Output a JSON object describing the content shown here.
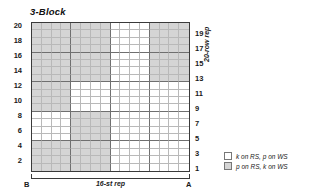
{
  "title": "3-Block",
  "axes": {
    "left_row_numbers": [
      20,
      18,
      16,
      14,
      12,
      10,
      8,
      6,
      4,
      2
    ],
    "right_row_numbers": [
      19,
      17,
      15,
      13,
      11,
      9,
      7,
      5,
      3,
      1
    ],
    "vertical_rep_label": "20-row rep",
    "horizontal_rep_label": "16-st rep",
    "left_marker": "B",
    "right_marker": "A"
  },
  "legend": [
    {
      "swatch": "white",
      "label": "k on RS, p on WS"
    },
    {
      "swatch": "gray",
      "label": "p on RS, k on WS"
    }
  ],
  "colors": {
    "gray_cell": "#d5d5d5",
    "white_cell": "#ffffff",
    "grid_line": "#b9b9b9",
    "block_line": "#6f6f6f",
    "frame": "#3a3a3a"
  },
  "chart_data": {
    "type": "heatmap",
    "title": "3-Block",
    "xlabel": "16-st rep",
    "ylabel": "20-row rep",
    "columns": 16,
    "rows": 20,
    "value_legend": {
      "1": "p on RS, k on WS",
      "0": "k on RS, p on WS"
    },
    "row_labels_top_to_bottom": [
      20,
      19,
      18,
      17,
      16,
      15,
      14,
      13,
      12,
      11,
      10,
      9,
      8,
      7,
      6,
      5,
      4,
      3,
      2,
      1
    ],
    "grid_top_to_bottom": [
      [
        1,
        1,
        1,
        1,
        1,
        1,
        1,
        1,
        0,
        0,
        0,
        0,
        1,
        1,
        1,
        1
      ],
      [
        1,
        1,
        1,
        1,
        1,
        1,
        1,
        1,
        0,
        0,
        0,
        0,
        1,
        1,
        1,
        1
      ],
      [
        1,
        1,
        1,
        1,
        1,
        1,
        1,
        1,
        0,
        0,
        0,
        0,
        1,
        1,
        1,
        1
      ],
      [
        1,
        1,
        1,
        1,
        1,
        1,
        1,
        1,
        0,
        0,
        0,
        0,
        1,
        1,
        1,
        1
      ],
      [
        1,
        1,
        1,
        1,
        1,
        1,
        1,
        1,
        0,
        0,
        0,
        0,
        1,
        1,
        1,
        1
      ],
      [
        1,
        1,
        1,
        1,
        1,
        1,
        1,
        1,
        0,
        0,
        0,
        0,
        1,
        1,
        1,
        1
      ],
      [
        1,
        1,
        1,
        1,
        1,
        1,
        1,
        1,
        0,
        0,
        0,
        0,
        1,
        1,
        1,
        1
      ],
      [
        1,
        1,
        1,
        1,
        1,
        1,
        1,
        1,
        0,
        0,
        0,
        0,
        1,
        1,
        1,
        1
      ],
      [
        1,
        1,
        1,
        1,
        0,
        0,
        0,
        0,
        0,
        0,
        0,
        0,
        0,
        0,
        0,
        0
      ],
      [
        1,
        1,
        1,
        1,
        0,
        0,
        0,
        0,
        0,
        0,
        0,
        0,
        0,
        0,
        0,
        0
      ],
      [
        1,
        1,
        1,
        1,
        0,
        0,
        0,
        0,
        0,
        0,
        0,
        0,
        0,
        0,
        0,
        0
      ],
      [
        1,
        1,
        1,
        1,
        0,
        0,
        0,
        0,
        0,
        0,
        0,
        0,
        0,
        0,
        0,
        0
      ],
      [
        0,
        0,
        0,
        0,
        1,
        1,
        1,
        1,
        0,
        0,
        0,
        0,
        0,
        0,
        0,
        0
      ],
      [
        0,
        0,
        0,
        0,
        1,
        1,
        1,
        1,
        0,
        0,
        0,
        0,
        0,
        0,
        0,
        0
      ],
      [
        0,
        0,
        0,
        0,
        1,
        1,
        1,
        1,
        0,
        0,
        0,
        0,
        0,
        0,
        0,
        0
      ],
      [
        0,
        0,
        0,
        0,
        1,
        1,
        1,
        1,
        0,
        0,
        0,
        0,
        0,
        0,
        0,
        0
      ],
      [
        1,
        1,
        1,
        1,
        1,
        1,
        1,
        1,
        0,
        0,
        0,
        0,
        0,
        0,
        0,
        0
      ],
      [
        1,
        1,
        1,
        1,
        1,
        1,
        1,
        1,
        0,
        0,
        0,
        0,
        0,
        0,
        0,
        0
      ],
      [
        1,
        1,
        1,
        1,
        1,
        1,
        1,
        1,
        0,
        0,
        0,
        0,
        0,
        0,
        0,
        0
      ],
      [
        1,
        1,
        1,
        1,
        1,
        1,
        1,
        1,
        0,
        0,
        0,
        0,
        0,
        0,
        0,
        0
      ]
    ]
  }
}
